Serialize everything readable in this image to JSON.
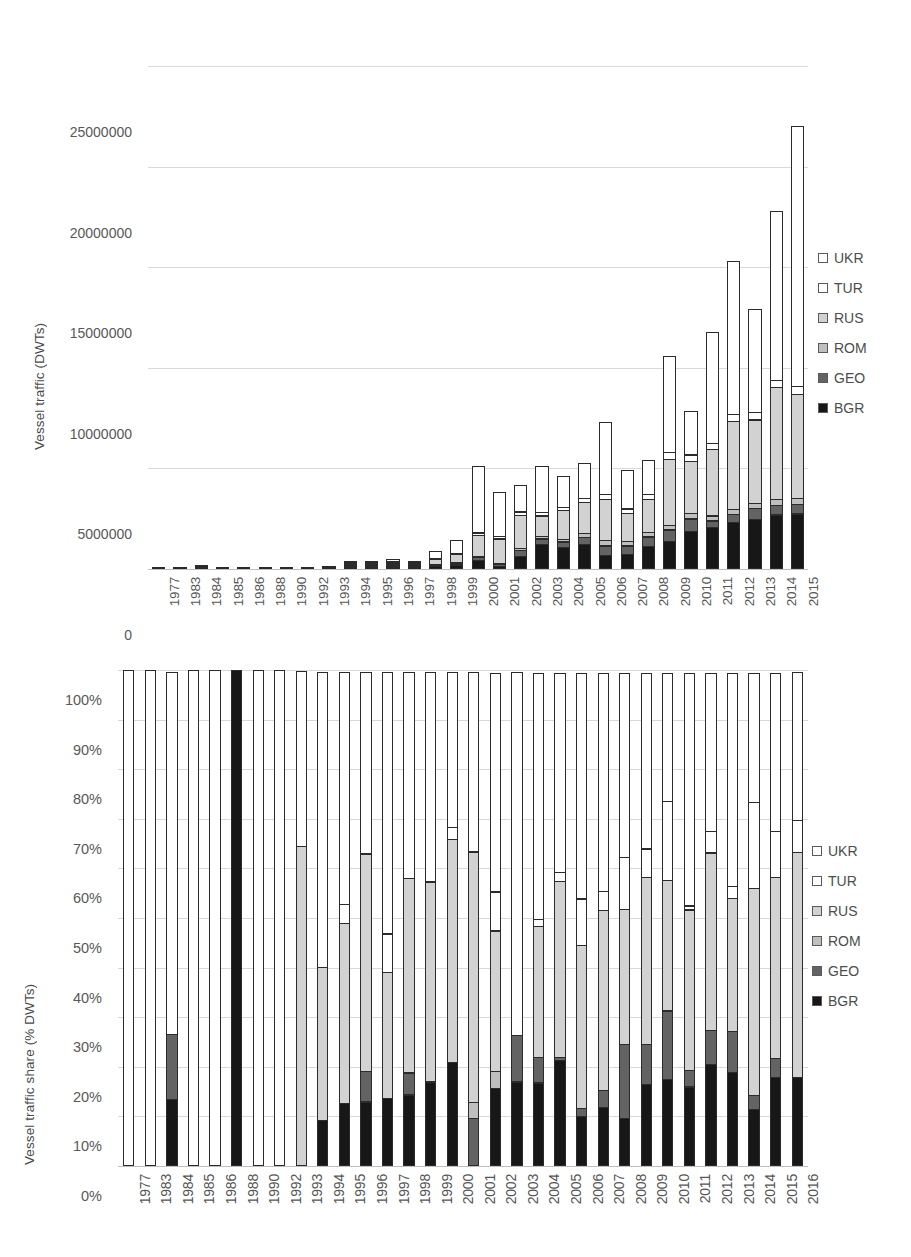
{
  "series_colors": {
    "UKR": "#ffffff",
    "TUR": "#ffffff",
    "RUS": "#d2d2d2",
    "ROM": "#bfbfbf",
    "GEO": "#636363",
    "BGR": "#171717"
  },
  "legend": {
    "items": [
      {
        "label": "UKR",
        "color": "#ffffff"
      },
      {
        "label": "TUR",
        "color": "#ffffff"
      },
      {
        "label": "RUS",
        "color": "#d2d2d2"
      },
      {
        "label": "ROM",
        "color": "#bfbfbf"
      },
      {
        "label": "GEO",
        "color": "#636363"
      },
      {
        "label": "BGR",
        "color": "#171717"
      }
    ]
  },
  "chart_data": [
    {
      "type": "bar",
      "id": "vessel-traffic-absolute",
      "stacked": true,
      "title": "",
      "xlabel": "",
      "ylabel": "Vessel traffic (DWTs)",
      "ylim": [
        0,
        25000000
      ],
      "yticks": [
        0,
        5000000,
        10000000,
        15000000,
        20000000,
        25000000
      ],
      "ytick_labels": [
        "0",
        "5000000",
        "10000000",
        "15000000",
        "20000000",
        "25000000"
      ],
      "grid": true,
      "legend_position": "right",
      "stack_order_bottom_to_top": [
        "BGR",
        "GEO",
        "ROM",
        "RUS",
        "TUR",
        "UKR"
      ],
      "categories": [
        "1977",
        "1983",
        "1984",
        "1985",
        "1986",
        "1988",
        "1990",
        "1992",
        "1993",
        "1994",
        "1995",
        "1996",
        "1997",
        "1998",
        "1999",
        "2000",
        "2001",
        "2002",
        "2003",
        "2004",
        "2005",
        "2006",
        "2007",
        "2008",
        "2009",
        "2010",
        "2011",
        "2012",
        "2013",
        "2014",
        "2015"
      ],
      "series": [
        {
          "name": "BGR",
          "values": [
            0,
            0,
            8000,
            0,
            0,
            0,
            0,
            0,
            0,
            30000,
            40000,
            75000,
            30000,
            130000,
            220000,
            460000,
            160000,
            640000,
            1250000,
            1100000,
            1250000,
            700000,
            750000,
            1150000,
            1400000,
            1900000,
            2100000,
            2350000,
            2500000,
            2700000,
            2750000
          ]
        },
        {
          "name": "GEO",
          "values": [
            0,
            0,
            10000,
            0,
            0,
            0,
            0,
            0,
            0,
            15000,
            25000,
            30000,
            15000,
            45000,
            70000,
            180000,
            120000,
            320000,
            300000,
            300000,
            380000,
            500000,
            450000,
            500000,
            600000,
            650000,
            350000,
            400000,
            550000,
            500000,
            500000
          ]
        },
        {
          "name": "ROM",
          "values": [
            0,
            0,
            0,
            0,
            0,
            0,
            0,
            0,
            0,
            5000,
            10000,
            15000,
            10000,
            30000,
            45000,
            80000,
            80000,
            150000,
            180000,
            180000,
            220000,
            300000,
            260000,
            250000,
            280000,
            300000,
            280000,
            320000,
            300000,
            350000,
            350000
          ]
        },
        {
          "name": "RUS",
          "values": [
            0,
            0,
            0,
            0,
            0,
            0,
            0,
            0,
            40000,
            70000,
            90000,
            140000,
            80000,
            270000,
            430000,
            1050000,
            1250000,
            1700000,
            1050000,
            1450000,
            1600000,
            2100000,
            1450000,
            1700000,
            3300000,
            2650000,
            3350000,
            4400000,
            4200000,
            5600000,
            5200000
          ]
        },
        {
          "name": "TUR",
          "values": [
            0,
            0,
            0,
            0,
            0,
            0,
            0,
            0,
            0,
            10000,
            15000,
            25000,
            20000,
            60000,
            80000,
            180000,
            150000,
            200000,
            200000,
            200000,
            250000,
            300000,
            250000,
            300000,
            400000,
            350000,
            350000,
            400000,
            400000,
            400000,
            450000
          ]
        },
        {
          "name": "UKR",
          "values": [
            8000,
            6000,
            12000,
            7000,
            6000,
            8000,
            8000,
            9000,
            25000,
            70000,
            130000,
            200000,
            110000,
            415000,
            705000,
            3350000,
            2250000,
            1390000,
            2350000,
            1570000,
            1750000,
            3600000,
            1950000,
            1700000,
            4800000,
            2200000,
            5570000,
            7630000,
            5150000,
            8450000,
            12950000
          ]
        }
      ]
    },
    {
      "type": "bar",
      "id": "vessel-traffic-share",
      "stacked": true,
      "normalized": true,
      "title": "",
      "xlabel": "",
      "ylabel": "Vessel traffic share (% DWTs)",
      "ylim": [
        0,
        100
      ],
      "yticks": [
        0,
        10,
        20,
        30,
        40,
        50,
        60,
        70,
        80,
        90,
        100
      ],
      "ytick_labels": [
        "0%",
        "10%",
        "20%",
        "30%",
        "40%",
        "50%",
        "60%",
        "70%",
        "80%",
        "90%",
        "100%"
      ],
      "grid": true,
      "legend_position": "right",
      "stack_order_bottom_to_top": [
        "BGR",
        "GEO",
        "ROM",
        "RUS",
        "TUR",
        "UKR"
      ],
      "categories": [
        "1977",
        "1983",
        "1984",
        "1985",
        "1986",
        "1988",
        "1990",
        "1992",
        "1993",
        "1994",
        "1995",
        "1996",
        "1997",
        "1998",
        "1999",
        "2000",
        "2001",
        "2002",
        "2003",
        "2004",
        "2005",
        "2006",
        "2007",
        "2008",
        "2009",
        "2010",
        "2011",
        "2012",
        "2013",
        "2014",
        "2015",
        "2016"
      ],
      "series": [
        {
          "name": "BGR",
          "values": [
            0,
            0,
            13.5,
            0,
            0,
            100,
            0,
            0,
            0,
            9.2,
            12.7,
            13.0,
            13.7,
            14.4,
            17.0,
            21.0,
            0,
            15.7,
            17.0,
            16.8,
            21.4,
            10.0,
            11.8,
            9.7,
            16.5,
            17.5,
            16.0,
            20.5,
            19.0,
            11.5,
            18.0,
            18.0
          ]
        },
        {
          "name": "GEO",
          "values": [
            0,
            0,
            13.3,
            0,
            0,
            0,
            0,
            0,
            0,
            0,
            0,
            6.3,
            0,
            4.6,
            0,
            0,
            9.6,
            0,
            9.5,
            5.4,
            0.8,
            1.9,
            3.6,
            15.0,
            8.2,
            14.0,
            3.5,
            7.0,
            8.4,
            2.9,
            4.0,
            0
          ]
        },
        {
          "name": "ROM",
          "values": [
            0,
            0,
            0,
            0,
            0,
            0,
            0,
            0,
            0,
            0,
            0,
            0,
            0,
            0,
            0,
            0,
            3.5,
            3.6,
            0,
            0,
            0,
            0,
            0,
            0,
            0,
            0,
            0,
            0,
            0,
            0,
            0,
            0
          ]
        },
        {
          "name": "RUS",
          "values": [
            0,
            0,
            0,
            0,
            0,
            0,
            0,
            0,
            64.5,
            31.0,
            36.5,
            44.0,
            25.5,
            39.4,
            40.5,
            45.0,
            50.6,
            28.5,
            0,
            26.5,
            35.5,
            33.0,
            36.5,
            27.5,
            33.8,
            26.5,
            32.5,
            36.0,
            27.0,
            42.0,
            36.5,
            45.5
          ]
        },
        {
          "name": "TUR",
          "values": [
            0,
            0,
            0,
            0,
            0,
            0,
            0,
            0,
            0,
            0,
            4.0,
            0,
            8.0,
            0,
            0,
            2.6,
            0,
            8.0,
            0,
            1.5,
            2.0,
            9.5,
            4.0,
            10.5,
            6.0,
            16.0,
            1.0,
            4.5,
            2.5,
            17.5,
            9.5,
            6.5
          ]
        },
        {
          "name": "UKR",
          "values": [
            100,
            100,
            73.2,
            100,
            100,
            0,
            100,
            100,
            35.5,
            59.8,
            46.8,
            36.7,
            52.8,
            41.6,
            42.5,
            31.4,
            36.3,
            44.2,
            73.5,
            49.8,
            40.3,
            45.6,
            44.1,
            37.3,
            35.5,
            26.0,
            47.0,
            32.0,
            43.1,
            26.1,
            32.0,
            30.0
          ]
        }
      ]
    }
  ]
}
